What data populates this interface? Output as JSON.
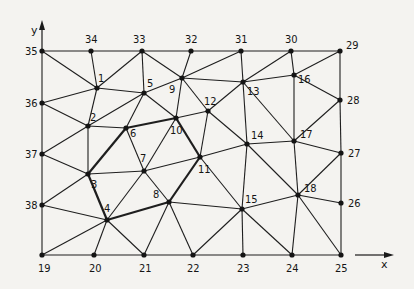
{
  "diagram": {
    "type": "finite-element-triangular-mesh",
    "axes": {
      "x_label": "x",
      "y_label": "y"
    },
    "nodes": [
      {
        "id": "1",
        "label": "1"
      },
      {
        "id": "2",
        "label": "2"
      },
      {
        "id": "3",
        "label": "3"
      },
      {
        "id": "4",
        "label": "4"
      },
      {
        "id": "5",
        "label": "5"
      },
      {
        "id": "6",
        "label": "6"
      },
      {
        "id": "7",
        "label": "7"
      },
      {
        "id": "8",
        "label": "8"
      },
      {
        "id": "9",
        "label": "9"
      },
      {
        "id": "10",
        "label": "10"
      },
      {
        "id": "11",
        "label": "11"
      },
      {
        "id": "12",
        "label": "12"
      },
      {
        "id": "13",
        "label": "13"
      },
      {
        "id": "14",
        "label": "14"
      },
      {
        "id": "15",
        "label": "15"
      },
      {
        "id": "16",
        "label": "16"
      },
      {
        "id": "17",
        "label": "17"
      },
      {
        "id": "18",
        "label": "18"
      },
      {
        "id": "19",
        "label": "19"
      },
      {
        "id": "20",
        "label": "20"
      },
      {
        "id": "21",
        "label": "21"
      },
      {
        "id": "22",
        "label": "22"
      },
      {
        "id": "23",
        "label": "23"
      },
      {
        "id": "24",
        "label": "24"
      },
      {
        "id": "25",
        "label": "25"
      },
      {
        "id": "26",
        "label": "26"
      },
      {
        "id": "27",
        "label": "27"
      },
      {
        "id": "28",
        "label": "28"
      },
      {
        "id": "29",
        "label": "29"
      },
      {
        "id": "30",
        "label": "30"
      },
      {
        "id": "31",
        "label": "31"
      },
      {
        "id": "32",
        "label": "32"
      },
      {
        "id": "33",
        "label": "33"
      },
      {
        "id": "34",
        "label": "34"
      },
      {
        "id": "35",
        "label": "35"
      },
      {
        "id": "36",
        "label": "36"
      },
      {
        "id": "37",
        "label": "37"
      },
      {
        "id": "38",
        "label": "38"
      }
    ],
    "edges": [
      [
        "35",
        "34"
      ],
      [
        "34",
        "33"
      ],
      [
        "33",
        "32"
      ],
      [
        "32",
        "31"
      ],
      [
        "31",
        "30"
      ],
      [
        "30",
        "29"
      ],
      [
        "19",
        "20"
      ],
      [
        "20",
        "21"
      ],
      [
        "21",
        "22"
      ],
      [
        "22",
        "23"
      ],
      [
        "23",
        "24"
      ],
      [
        "24",
        "25"
      ],
      [
        "35",
        "36"
      ],
      [
        "36",
        "37"
      ],
      [
        "37",
        "38"
      ],
      [
        "38",
        "19"
      ],
      [
        "29",
        "28"
      ],
      [
        "28",
        "27"
      ],
      [
        "27",
        "26"
      ],
      [
        "26",
        "25"
      ],
      [
        "35",
        "1"
      ],
      [
        "34",
        "1"
      ],
      [
        "33",
        "1"
      ],
      [
        "33",
        "5"
      ],
      [
        "1",
        "5"
      ],
      [
        "1",
        "36"
      ],
      [
        "1",
        "2"
      ],
      [
        "36",
        "2"
      ],
      [
        "5",
        "2"
      ],
      [
        "5",
        "6"
      ],
      [
        "5",
        "10"
      ],
      [
        "5",
        "9"
      ],
      [
        "2",
        "6"
      ],
      [
        "9",
        "10"
      ],
      [
        "2",
        "3"
      ],
      [
        "37",
        "2"
      ],
      [
        "33",
        "9"
      ],
      [
        "32",
        "9"
      ],
      [
        "31",
        "9"
      ],
      [
        "9",
        "13"
      ],
      [
        "9",
        "12"
      ],
      [
        "31",
        "13"
      ],
      [
        "13",
        "12"
      ],
      [
        "30",
        "13"
      ],
      [
        "30",
        "16"
      ],
      [
        "29",
        "16"
      ],
      [
        "13",
        "16"
      ],
      [
        "16",
        "28"
      ],
      [
        "16",
        "17"
      ],
      [
        "13",
        "17"
      ],
      [
        "13",
        "14"
      ],
      [
        "28",
        "17"
      ],
      [
        "14",
        "17"
      ],
      [
        "17",
        "27"
      ],
      [
        "10",
        "12"
      ],
      [
        "12",
        "11"
      ],
      [
        "12",
        "14"
      ],
      [
        "10",
        "7"
      ],
      [
        "6",
        "7"
      ],
      [
        "7",
        "11"
      ],
      [
        "11",
        "14"
      ],
      [
        "11",
        "15"
      ],
      [
        "7",
        "8"
      ],
      [
        "8",
        "15"
      ],
      [
        "14",
        "15"
      ],
      [
        "14",
        "18"
      ],
      [
        "17",
        "18"
      ],
      [
        "27",
        "18"
      ],
      [
        "18",
        "26"
      ],
      [
        "15",
        "18"
      ],
      [
        "15",
        "23"
      ],
      [
        "15",
        "24"
      ],
      [
        "18",
        "24"
      ],
      [
        "18",
        "25"
      ],
      [
        "37",
        "3"
      ],
      [
        "3",
        "7"
      ],
      [
        "3",
        "38"
      ],
      [
        "38",
        "4"
      ],
      [
        "4",
        "7"
      ],
      [
        "19",
        "4"
      ],
      [
        "20",
        "4"
      ],
      [
        "21",
        "4"
      ],
      [
        "8",
        "21"
      ],
      [
        "8",
        "22"
      ],
      [
        "22",
        "15"
      ]
    ],
    "highlighted_boundary": [
      [
        "3",
        "6"
      ],
      [
        "6",
        "10"
      ],
      [
        "10",
        "11"
      ],
      [
        "11",
        "8"
      ],
      [
        "8",
        "4"
      ],
      [
        "4",
        "3"
      ]
    ]
  }
}
